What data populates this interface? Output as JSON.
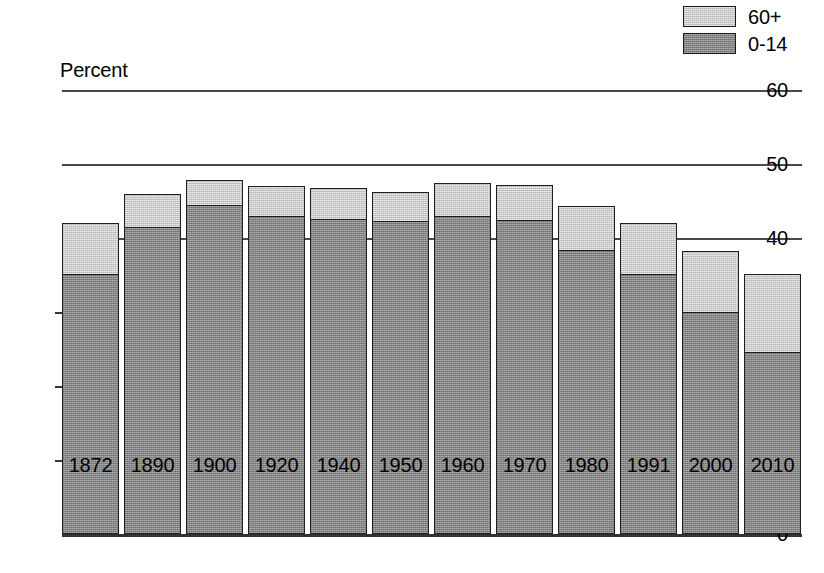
{
  "chart_data": {
    "type": "bar",
    "subtype": "stacked-bar",
    "title": "",
    "xlabel": "",
    "ylabel": "Percent",
    "ylim": [
      0,
      60
    ],
    "yticks": [
      0,
      10,
      20,
      30,
      40,
      50,
      60
    ],
    "grid": "horizontal-at-40-50-60",
    "legend_position": "top-right",
    "categories": [
      "1872",
      "1890",
      "1900",
      "1920",
      "1940",
      "1950",
      "1960",
      "1970",
      "1980",
      "1991",
      "2000",
      "2010"
    ],
    "series": [
      {
        "name": "0-14",
        "color": "#848484",
        "values": [
          35.0,
          41.3,
          44.3,
          42.8,
          42.5,
          42.2,
          42.8,
          42.3,
          38.3,
          35.0,
          29.9,
          24.5
        ]
      },
      {
        "name": "60+",
        "color": "#c9c9c9",
        "values": [
          7.0,
          4.7,
          3.5,
          4.2,
          4.3,
          4.0,
          4.7,
          4.9,
          6.0,
          7.0,
          8.4,
          10.7
        ]
      }
    ],
    "totals": [
      42.0,
      46.0,
      47.8,
      47.0,
      46.8,
      46.2,
      47.5,
      47.2,
      44.3,
      42.0,
      38.3,
      35.2
    ]
  },
  "axis": {
    "y_title": "Percent",
    "y_labels": [
      "60",
      "50",
      "40",
      "30",
      "20",
      "10",
      "0"
    ],
    "x_labels": [
      "1872",
      "1890",
      "1900",
      "1920",
      "1940",
      "1950",
      "1960",
      "1970",
      "1980",
      "1991",
      "2000",
      "2010"
    ]
  },
  "legend": {
    "items": [
      {
        "label": "60+",
        "swatch": "light-gray-swatch",
        "color": "#c9c9c9"
      },
      {
        "label": "0-14",
        "swatch": "dark-gray-swatch",
        "color": "#848484"
      }
    ]
  }
}
